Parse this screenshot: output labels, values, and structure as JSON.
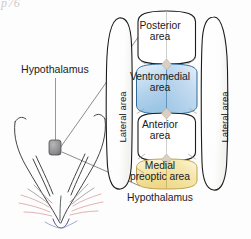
{
  "figure": {
    "title_scrap": "p76",
    "callout_label": "Hypothalamus",
    "bottom_label": "Hypothalamus",
    "regions": [
      {
        "name": "posterior-area",
        "label_line1": "Posterior",
        "label_line2": "area",
        "fill": "#ffffff"
      },
      {
        "name": "ventromedial-area",
        "label_line1": "Ventromedial",
        "label_line2": "area",
        "fill": "#b6d4ec"
      },
      {
        "name": "anterior-area",
        "label_line1": "Anterior",
        "label_line2": "area",
        "fill": "#ffffff"
      },
      {
        "name": "medial-preoptic-area",
        "label_line1": "Medial",
        "label_line2": "preoptic area",
        "fill": "#f4de9a"
      }
    ],
    "lateral_left": "Lateral area",
    "lateral_right": "Lateral area",
    "colors": {
      "outline": "#1c1c1c",
      "blue_light": "#e3eff9",
      "blue_mid": "#b9d6ee",
      "blue_deep": "#8fbcdf",
      "yellow_light": "#fdf6dc",
      "yellow_mid": "#f6e4a4",
      "yellow_deep": "#e8cf77",
      "diamond": "#d8cfc2",
      "head_line": "#3a3a3c",
      "probe_gray": "#8e8e90",
      "whisker_pink": "#d79a9a",
      "whisker_blue": "#7f8fc0",
      "nose": "#3f3f7a"
    }
  }
}
